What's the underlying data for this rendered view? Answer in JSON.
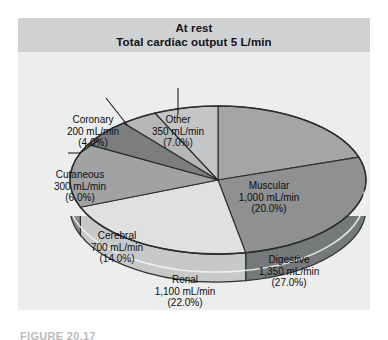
{
  "header": {
    "line1": "At rest",
    "line2": "Total cardiac output 5 L/min"
  },
  "caption": "FIGURE 20.17",
  "labels": {
    "coronary": {
      "name": "Coronary",
      "flow": "200 mL/min",
      "pct": "(4.0%)"
    },
    "other": {
      "name": "Other",
      "flow": "350 mL/min",
      "pct": "(7.0%)"
    },
    "cutaneous": {
      "name": "Cutaneous",
      "flow": "300 mL/min",
      "pct": "(6.0%)"
    },
    "cerebral": {
      "name": "Cerebral",
      "flow": "700 mL/min",
      "pct": "(14.0%)"
    },
    "muscular": {
      "name": "Muscular",
      "flow": "1,000 mL/min",
      "pct": "(20.0%)"
    },
    "digestive": {
      "name": "Digestive",
      "flow": "1,350 mL/min",
      "pct": "(27.0%)"
    },
    "renal": {
      "name": "Renal",
      "flow": "1,100 mL/min",
      "pct": "(22.0%)"
    }
  },
  "chart_data": {
    "type": "pie",
    "subtitle": "Distribution of cardiac output by organ system at rest",
    "unit": "mL/min",
    "total": 5000,
    "total_label": "5 L/min",
    "three_d": true,
    "legend": "none (slices labeled directly with leader lines)",
    "labels": [
      "Muscular",
      "Digestive",
      "Renal",
      "Cerebral",
      "Cutaneous",
      "Coronary",
      "Other"
    ],
    "values": [
      1000,
      1350,
      1100,
      700,
      300,
      200,
      350
    ],
    "percents": [
      20.0,
      27.0,
      22.0,
      14.0,
      6.0,
      4.0,
      7.0
    ],
    "value_labels": [
      "1,000 mL/min",
      "1,350 mL/min",
      "1,100 mL/min",
      "700 mL/min",
      "300 mL/min",
      "200 mL/min",
      "350 mL/min"
    ],
    "percent_labels": [
      "(20.0%)",
      "(27.0%)",
      "(22.0%)",
      "(14.0%)",
      "(6.0%)",
      "(4.0%)",
      "(7.0%)"
    ],
    "slice_fills": [
      "#a3a5a6",
      "#8e9091",
      "#dfe0e0",
      "#a0a2a3",
      "#7b7d7e",
      "#b4b6b7",
      "#c3c5c6"
    ],
    "slice_walls": [
      "#8e9091",
      "#76797a",
      "#c7c9c9",
      "#8a8c8d",
      "#6a6c6d",
      "#9a9c9d",
      "#aaacad"
    ],
    "colors": {
      "panel_bg": "#eceded",
      "header_bg": "#cfd1d2",
      "outline": "#2b2d2f",
      "text": "#0d0e10"
    }
  }
}
